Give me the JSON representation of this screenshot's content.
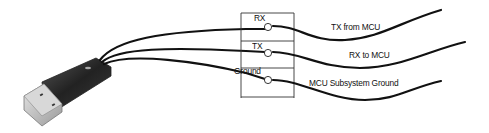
{
  "diagram": {
    "device": "USB connector",
    "connector_pins": [
      {
        "label": "RX",
        "wire_label": "TX from MCU"
      },
      {
        "label": "TX",
        "wire_label": "RX to MCU"
      },
      {
        "label": "Ground",
        "wire_label": "MCU Subsystem Ground"
      }
    ],
    "colors": {
      "wire": "#111111",
      "box": "#333333",
      "background": "#ffffff"
    }
  }
}
